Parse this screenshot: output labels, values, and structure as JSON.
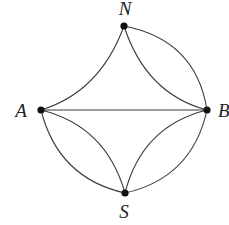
{
  "diagram": {
    "type": "multigraph",
    "colors": {
      "background": "#ffffff",
      "edge": "#3a3a3a",
      "node": "#111111",
      "label": "#222222"
    },
    "nodes": [
      {
        "id": "N",
        "label": "N",
        "x": 124,
        "y": 26,
        "label_x": 125,
        "label_y": 15,
        "anchor": "middle"
      },
      {
        "id": "A",
        "label": "A",
        "x": 41,
        "y": 110,
        "label_x": 21,
        "label_y": 117,
        "anchor": "middle"
      },
      {
        "id": "B",
        "label": "B",
        "x": 207,
        "y": 110,
        "label_x": 218,
        "label_y": 117,
        "anchor": "start"
      },
      {
        "id": "S",
        "label": "S",
        "x": 125,
        "y": 193,
        "label_x": 124,
        "label_y": 218,
        "anchor": "middle"
      }
    ],
    "edges": [
      {
        "from": "A",
        "to": "N",
        "curve": "concave-inward",
        "cx": 100,
        "cy": 92
      },
      {
        "from": "N",
        "to": "B",
        "curve": "convex-outward",
        "cx": 196,
        "cy": 40
      },
      {
        "from": "N",
        "to": "B",
        "curve": "concave-inward",
        "cx": 146,
        "cy": 94
      },
      {
        "from": "A",
        "to": "B",
        "curve": "straight"
      },
      {
        "from": "A",
        "to": "S",
        "curve": "convex-outward",
        "cx": 58,
        "cy": 178
      },
      {
        "from": "A",
        "to": "S",
        "curve": "concave-inward",
        "cx": 106,
        "cy": 126
      },
      {
        "from": "B",
        "to": "S",
        "curve": "convex-outward",
        "cx": 192,
        "cy": 178
      },
      {
        "from": "B",
        "to": "S",
        "curve": "concave-inward",
        "cx": 142,
        "cy": 126
      }
    ],
    "edge_counts": {
      "A-N": 1,
      "N-B": 2,
      "A-B": 1,
      "A-S": 2,
      "B-S": 2
    }
  }
}
